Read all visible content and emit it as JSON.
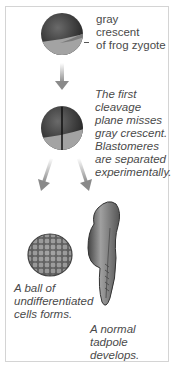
{
  "diagram": {
    "zygote_label": [
      "gray",
      "crescent",
      "of frog zygote"
    ],
    "cleavage_caption": [
      "The first",
      "cleavage",
      "plane misses",
      "gray crescent.",
      "Blastomeres",
      "are separated",
      "experimentally."
    ],
    "ball_caption": [
      "A ball of",
      "undifferentiated",
      "cells forms."
    ],
    "tadpole_caption": [
      "A normal",
      "tadpole",
      "develops."
    ]
  },
  "colors": {
    "frame_border": "#d4d4d4",
    "text": "#4a4a4a",
    "embryo_dark": "#3a3a3a",
    "embryo_light": "#9a9a9a",
    "arrow": "#8a8a8a"
  }
}
